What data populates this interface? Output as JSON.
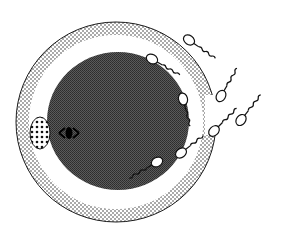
{
  "diagram": {
    "type": "illustration",
    "colors": {
      "background": "#ffffff",
      "ink": "#1a1a1a",
      "zona_dots": "#2a2a2a",
      "cytoplasm": "#4a4a4a",
      "cytoplasm_dots": "#2c2c2c"
    },
    "zona": {
      "cx": 116,
      "cy": 122,
      "r_outer": 100,
      "r_inner": 87
    },
    "cytoplasm": {
      "cx": 118,
      "cy": 121,
      "rx": 71,
      "ry": 69
    },
    "polar_body": {
      "cx": 40,
      "cy": 133,
      "rx": 10,
      "ry": 16
    },
    "pronucleus": {
      "cx": 69,
      "cy": 133
    },
    "sperm": [
      {
        "hx": 189,
        "hy": 40,
        "angle": 35
      },
      {
        "hx": 152,
        "hy": 59,
        "angle": 30
      },
      {
        "hx": 183,
        "hy": 99,
        "angle": 75
      },
      {
        "hx": 221,
        "hy": 96,
        "angle": -60
      },
      {
        "hx": 241,
        "hy": 120,
        "angle": -52
      },
      {
        "hx": 214,
        "hy": 131,
        "angle": -45
      },
      {
        "hx": 181,
        "hy": 153,
        "angle": -38
      },
      {
        "hx": 157,
        "hy": 162,
        "angle": -30
      }
    ]
  }
}
